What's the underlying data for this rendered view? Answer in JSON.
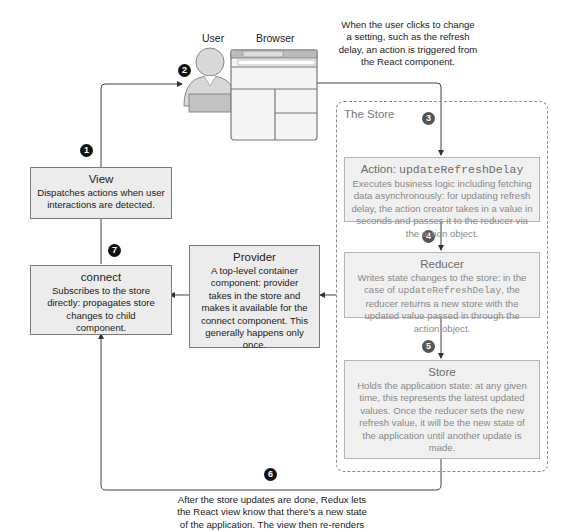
{
  "actors": {
    "user_label": "User",
    "browser_label": "Browser"
  },
  "top_caption": "When the user clicks to change a setting, such as the refresh delay, an action is triggered from the React component.",
  "bottom_caption": "After the store updates are done, Redux lets the React view know that there's a new state of the application. The view then re-renders",
  "badges": [
    "1",
    "2",
    "3",
    "4",
    "5",
    "6",
    "7"
  ],
  "view": {
    "title": "View",
    "desc": "Dispatches actions when user interactions are detected."
  },
  "connect": {
    "title": "connect",
    "desc": "Subscribes to the store directly: propagates store changes to child component."
  },
  "provider": {
    "title": "Provider",
    "desc": "A top-level container component: provider takes in the store and makes it available for the connect component. This generally happens only once."
  },
  "store_group": {
    "label": "The Store",
    "action": {
      "title_prefix": "Action: ",
      "title_code": "updateRefreshDelay",
      "desc": "Executes business logic including fetching data asynchronously: for updating refresh delay, the action creator takes in a value in seconds and passes it to the reducer via the action object."
    },
    "reducer": {
      "title": "Reducer",
      "desc_before": "Writes state changes to the store: in the case of ",
      "desc_code": "updateRefreshDelay",
      "desc_after": ", the reducer returns a new store with the updated value passed in through the action object."
    },
    "store": {
      "title": "Store",
      "desc": "Holds the application state: at any given time, this represents the latest updated values. Once the reducer sets the new refresh value, it will be the new state of the application until another update is made."
    }
  },
  "colors": {
    "box_fill": "#ececec",
    "box_border": "#7a7a7a",
    "faded_text": "#8a8a8a",
    "badge": "#111111",
    "line": "#444444"
  }
}
